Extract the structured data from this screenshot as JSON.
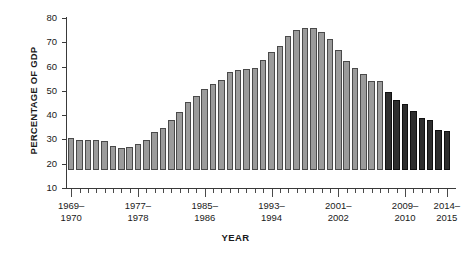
{
  "chart_data": {
    "type": "bar",
    "title": "",
    "xlabel": "YEAR",
    "ylabel": "PERCENTAGE OF GDP",
    "ylim": [
      10,
      80
    ],
    "ytick_values": [
      10,
      20,
      30,
      40,
      50,
      60,
      70,
      80
    ],
    "ytick_labels": [
      "10",
      "20",
      "30",
      "40",
      "50",
      "60",
      "70",
      "80"
    ],
    "grid": false,
    "legend": "none",
    "x_major_labels": [
      {
        "index": 0,
        "label": "1969–\n1970"
      },
      {
        "index": 8,
        "label": "1977–\n1978"
      },
      {
        "index": 16,
        "label": "1985–\n1986"
      },
      {
        "index": 24,
        "label": "1993–\n1994"
      },
      {
        "index": 32,
        "label": "2001–\n2002"
      },
      {
        "index": 40,
        "label": "2009–\n2010"
      },
      {
        "index": 45,
        "label": "2014–\n2015"
      }
    ],
    "categories": [
      "1969-1970",
      "1970-1971",
      "1971-1972",
      "1972-1973",
      "1973-1974",
      "1974-1975",
      "1975-1976",
      "1976-1977",
      "1977-1978",
      "1978-1979",
      "1979-1980",
      "1980-1981",
      "1981-1982",
      "1982-1983",
      "1983-1984",
      "1984-1985",
      "1985-1986",
      "1986-1987",
      "1987-1988",
      "1988-1989",
      "1989-1990",
      "1990-1991",
      "1991-1992",
      "1992-1993",
      "1993-1994",
      "1994-1995",
      "1995-1996",
      "1996-1997",
      "1997-1998",
      "1998-1999",
      "1999-2000",
      "2000-2001",
      "2001-2002",
      "2002-2003",
      "2003-2004",
      "2004-2005",
      "2005-2006",
      "2006-2007",
      "2007-2008",
      "2008-2009",
      "2009-2010",
      "2010-2011",
      "2011-2012",
      "2012-2013",
      "2013-2014",
      "2014-2015"
    ],
    "series": [
      {
        "name": "Percentage of GDP",
        "color_actual": "#9b9b9b",
        "color_projected": "#2e2e2e",
        "projected_from_index": 38,
        "values": [
          23.0,
          22.5,
          22.5,
          22.3,
          22.0,
          20.0,
          19.0,
          19.5,
          20.8,
          22.5,
          25.5,
          27.5,
          30.5,
          34.0,
          38.0,
          40.5,
          43.5,
          45.5,
          47.0,
          50.5,
          51.0,
          51.5,
          52.0,
          55.5,
          58.5,
          61.0,
          65.0,
          67.5,
          68.5,
          68.5,
          67.0,
          64.0,
          59.5,
          55.0,
          52.0,
          49.5,
          46.5,
          46.5,
          42.0,
          39.0,
          37.0,
          34.5,
          31.5,
          30.5,
          26.5,
          26.0
        ]
      }
    ]
  }
}
